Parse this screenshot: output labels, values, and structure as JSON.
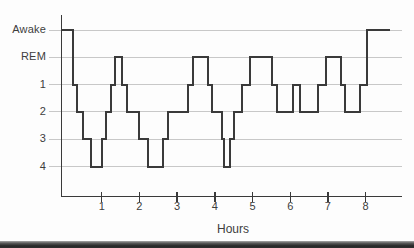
{
  "figure": {
    "kind": "sleep hypnogram (sleep stages across one night)",
    "background_color": "#fdfdfd",
    "bottom_edge_bar_color": "#2b2b2b"
  },
  "chart_data": {
    "type": "line",
    "subtype": "step-hypnogram",
    "title": "",
    "xlabel": "Hours",
    "ylabel": "",
    "x_ticks": [
      1,
      2,
      3,
      4,
      5,
      6,
      7,
      8
    ],
    "x_range_hours": [
      0,
      8.65
    ],
    "y_labels": [
      "Awake",
      "REM",
      "1",
      "2",
      "3",
      "4"
    ],
    "grid": "horizontal-only",
    "line_color": "#3a3a3a",
    "grid_color": "#c8c8c8",
    "text_color": "#3d3d3d",
    "segments": [
      {
        "stage": "Awake",
        "from": 0.0,
        "to": 0.25
      },
      {
        "stage": "1",
        "from": 0.25,
        "to": 0.35
      },
      {
        "stage": "2",
        "from": 0.35,
        "to": 0.5
      },
      {
        "stage": "3",
        "from": 0.5,
        "to": 0.72
      },
      {
        "stage": "4",
        "from": 0.72,
        "to": 1.0
      },
      {
        "stage": "3",
        "from": 1.0,
        "to": 1.12
      },
      {
        "stage": "2",
        "from": 1.12,
        "to": 1.25
      },
      {
        "stage": "1",
        "from": 1.25,
        "to": 1.36
      },
      {
        "stage": "REM",
        "from": 1.36,
        "to": 1.55
      },
      {
        "stage": "1",
        "from": 1.55,
        "to": 1.67
      },
      {
        "stage": "2",
        "from": 1.67,
        "to": 2.0
      },
      {
        "stage": "3",
        "from": 2.0,
        "to": 2.22
      },
      {
        "stage": "4",
        "from": 2.22,
        "to": 2.63
      },
      {
        "stage": "3",
        "from": 2.63,
        "to": 2.75
      },
      {
        "stage": "2",
        "from": 2.75,
        "to": 3.28
      },
      {
        "stage": "1",
        "from": 3.28,
        "to": 3.43
      },
      {
        "stage": "REM",
        "from": 3.43,
        "to": 3.82
      },
      {
        "stage": "1",
        "from": 3.82,
        "to": 3.93
      },
      {
        "stage": "2",
        "from": 3.93,
        "to": 4.19
      },
      {
        "stage": "3",
        "from": 4.19,
        "to": 4.25
      },
      {
        "stage": "4",
        "from": 4.25,
        "to": 4.41
      },
      {
        "stage": "3",
        "from": 4.41,
        "to": 4.52
      },
      {
        "stage": "2",
        "from": 4.52,
        "to": 4.73
      },
      {
        "stage": "1",
        "from": 4.73,
        "to": 4.93
      },
      {
        "stage": "REM",
        "from": 4.93,
        "to": 5.53
      },
      {
        "stage": "1",
        "from": 5.53,
        "to": 5.64
      },
      {
        "stage": "2",
        "from": 5.64,
        "to": 6.08
      },
      {
        "stage": "1",
        "from": 6.08,
        "to": 6.26
      },
      {
        "stage": "2",
        "from": 6.26,
        "to": 6.75
      },
      {
        "stage": "1",
        "from": 6.75,
        "to": 6.94
      },
      {
        "stage": "REM",
        "from": 6.94,
        "to": 7.35
      },
      {
        "stage": "1",
        "from": 7.35,
        "to": 7.45
      },
      {
        "stage": "2",
        "from": 7.45,
        "to": 7.85
      },
      {
        "stage": "1",
        "from": 7.85,
        "to": 8.04
      },
      {
        "stage": "Awake",
        "from": 8.04,
        "to": 8.65
      }
    ]
  }
}
